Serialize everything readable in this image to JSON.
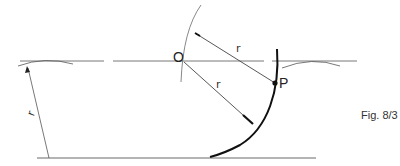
{
  "diagram": {
    "caption": "Fig. 8/3",
    "labels": {
      "center": "O",
      "point": "P",
      "radius_upper": "r",
      "radius_lower": "r",
      "radius_left": "r"
    },
    "colors": {
      "thin_line": "#555555",
      "thick_curve": "#111111",
      "text": "#222222"
    }
  }
}
